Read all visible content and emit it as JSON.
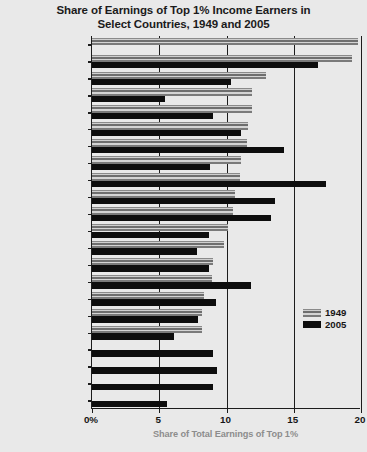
{
  "chart_data": {
    "type": "bar",
    "orientation": "horizontal",
    "title": "Share of Earnings of Top 1% Income Earners in Select Countries, 1949 and 2005",
    "title_lines": [
      "Share of Earnings of Top 1% Income Earners in",
      "Select Countries, 1949 and 2005"
    ],
    "xlabel": "Share of Total Earnings of Top 1%",
    "ylabel": "",
    "xlim": [
      0,
      20
    ],
    "xticks": [
      0,
      5,
      10,
      15,
      20
    ],
    "xtick_labels": [
      "0%",
      "5",
      "10",
      "15",
      "20"
    ],
    "grid": true,
    "legend_position": "center-right",
    "categories": [
      "Indonesia",
      "Argentina",
      "Ireland",
      "Netherlands",
      "India",
      "Germany",
      "United Kingdom",
      "Australia",
      "United States",
      "Canada",
      "Singapore",
      "New Zealand",
      "Switzerland",
      "France",
      "Norway",
      "Japan",
      "Finland",
      "Sweden",
      "Spain",
      "Portugal",
      "Italy",
      "China"
    ],
    "series": [
      {
        "name": "1949",
        "color": "#9a9a9a",
        "values": [
          19.8,
          19.3,
          12.9,
          11.9,
          11.9,
          11.6,
          11.5,
          11.1,
          11.0,
          10.6,
          10.5,
          10.1,
          9.8,
          9.0,
          8.9,
          8.3,
          8.2,
          8.2,
          null,
          null,
          null,
          null
        ]
      },
      {
        "name": "2005",
        "color": "#0d0d0d",
        "values": [
          null,
          16.8,
          10.3,
          5.4,
          9.0,
          11.1,
          14.3,
          8.8,
          17.4,
          13.6,
          13.3,
          8.7,
          7.8,
          8.7,
          11.8,
          9.2,
          7.9,
          6.1,
          9.0,
          9.3,
          9.0,
          5.6
        ]
      }
    ]
  },
  "legend": {
    "items": [
      {
        "label": "1949",
        "swatch": "gray"
      },
      {
        "label": "2005",
        "swatch": "black"
      }
    ]
  },
  "colors": {
    "background": "#e9e9e9",
    "axis": "#1c1c1c",
    "series_1949": "#9a9a9a",
    "series_2005": "#0d0d0d",
    "xlabel_text": "#8d8d8d",
    "text": "#161616"
  }
}
